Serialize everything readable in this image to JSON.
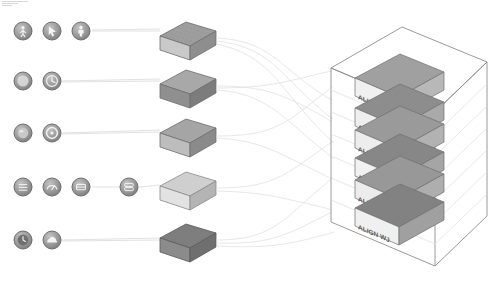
{
  "diagram": {
    "title": "Multi-stage data fusion pipeline diagram",
    "background_color": "#ffffff",
    "corner_mark": "header-rule-marks",
    "palette": {
      "icon_fill": "#9a9a9a",
      "icon_stroke": "#6e6e6e",
      "icon_glyph": "#f2f2f2",
      "connector": "#d6d6d6",
      "connector_faint": "#e4e4e4",
      "wireframe": "#8a8a8a",
      "block_label_bg": "#efefef",
      "block_label_text": "#5e5e5e"
    }
  },
  "input_rows": [
    {
      "row_id": "row-1",
      "y": 31,
      "icons": [
        {
          "name": "pedestrian-icon",
          "glyph": "person",
          "cx": 23,
          "cy": 31,
          "r": 9
        },
        {
          "name": "cursor-icon",
          "glyph": "cursor",
          "cx": 52,
          "cy": 31,
          "r": 9
        },
        {
          "name": "person-marker-icon",
          "glyph": "person-pin",
          "cx": 81,
          "cy": 31,
          "r": 9
        }
      ]
    },
    {
      "row_id": "row-2",
      "y": 81,
      "icons": [
        {
          "name": "circle-blank-icon",
          "glyph": "blank",
          "cx": 23,
          "cy": 81,
          "r": 9
        },
        {
          "name": "dial-icon",
          "glyph": "dial",
          "cx": 52,
          "cy": 81,
          "r": 9
        }
      ]
    },
    {
      "row_id": "row-3",
      "y": 133,
      "icons": [
        {
          "name": "orb-icon",
          "glyph": "orb",
          "cx": 23,
          "cy": 133,
          "r": 9
        },
        {
          "name": "ring-icon",
          "glyph": "ring",
          "cx": 52,
          "cy": 133,
          "r": 9
        }
      ]
    },
    {
      "row_id": "row-4",
      "y": 187,
      "icons": [
        {
          "name": "grid-icon",
          "glyph": "grid",
          "cx": 23,
          "cy": 187,
          "r": 9
        },
        {
          "name": "gauge-icon",
          "glyph": "gauge",
          "cx": 52,
          "cy": 187,
          "r": 9
        },
        {
          "name": "tray-icon",
          "glyph": "tray",
          "cx": 81,
          "cy": 187,
          "r": 9
        },
        {
          "name": "server-icon",
          "glyph": "server",
          "cx": 129,
          "cy": 187,
          "r": 9
        }
      ]
    },
    {
      "row_id": "row-5",
      "y": 240,
      "icons": [
        {
          "name": "clock-icon",
          "glyph": "clock",
          "cx": 23,
          "cy": 240,
          "r": 9
        },
        {
          "name": "cloud-icon",
          "glyph": "cloud",
          "cx": 52,
          "cy": 240,
          "r": 9
        }
      ]
    }
  ],
  "stage_blocks": [
    {
      "name": "block-1",
      "cx": 186,
      "cy": 40,
      "top_fill": "#9e9e9e",
      "front_fill": "#c9c9c9",
      "side_fill": "#8e8e8e",
      "texture": "speckled"
    },
    {
      "name": "block-2",
      "cx": 186,
      "cy": 88,
      "top_fill": "#a8a8a8",
      "front_fill": "#8f8f8f",
      "side_fill": "#7c7c7c",
      "texture": "plain"
    },
    {
      "name": "block-3",
      "cx": 186,
      "cy": 137,
      "top_fill": "#a5a5a5",
      "front_fill": "#bdbdbd",
      "side_fill": "#8a8a8a",
      "texture": "plain"
    },
    {
      "name": "block-4",
      "cx": 186,
      "cy": 190,
      "top_fill": "#cfcfcf",
      "front_fill": "#e2e2e2",
      "side_fill": "#b4b4b4",
      "texture": "plain"
    },
    {
      "name": "block-5",
      "cx": 186,
      "cy": 242,
      "top_fill": "#7f7f7f",
      "front_fill": "#8b8b8b",
      "side_fill": "#6f6f6f",
      "texture": "speckled"
    }
  ],
  "output_stack": {
    "name": "fused-output-stack",
    "wireframe_label": "bounding-volume",
    "layers": [
      {
        "name": "stack-layer-1",
        "label": "ALIGN WJ",
        "top_fill": "#a0a0a0",
        "front_fill": "#f0f0f0",
        "side_fill": "#b8b8b8"
      },
      {
        "name": "stack-layer-2",
        "label": "ALIGN WJ",
        "top_fill": "#8d8d8d",
        "front_fill": "#efefef",
        "side_fill": "#a9a9a9"
      },
      {
        "name": "stack-layer-3",
        "label": "ALIGN WJ",
        "top_fill": "#9a9a9a",
        "front_fill": "#ededed",
        "side_fill": "#b2b2b2"
      },
      {
        "name": "stack-layer-4",
        "label": "ALIGN WJ",
        "top_fill": "#878787",
        "front_fill": "#f1f1f1",
        "side_fill": "#a5a5a5"
      },
      {
        "name": "stack-layer-5",
        "label": "ALIGN WJ",
        "top_fill": "#989898",
        "front_fill": "#ececec",
        "side_fill": "#aeaeae"
      },
      {
        "name": "stack-layer-6",
        "label": "ALIGN WJ",
        "top_fill": "#828282",
        "front_fill": "#f0f0f0",
        "side_fill": "#a0a0a0"
      }
    ]
  },
  "connectors": {
    "left_group_label": "sensor-to-stage-links",
    "right_group_label": "stage-to-output-links",
    "stroke": "#dadada",
    "stroke_faint": "#e8e8e8"
  }
}
